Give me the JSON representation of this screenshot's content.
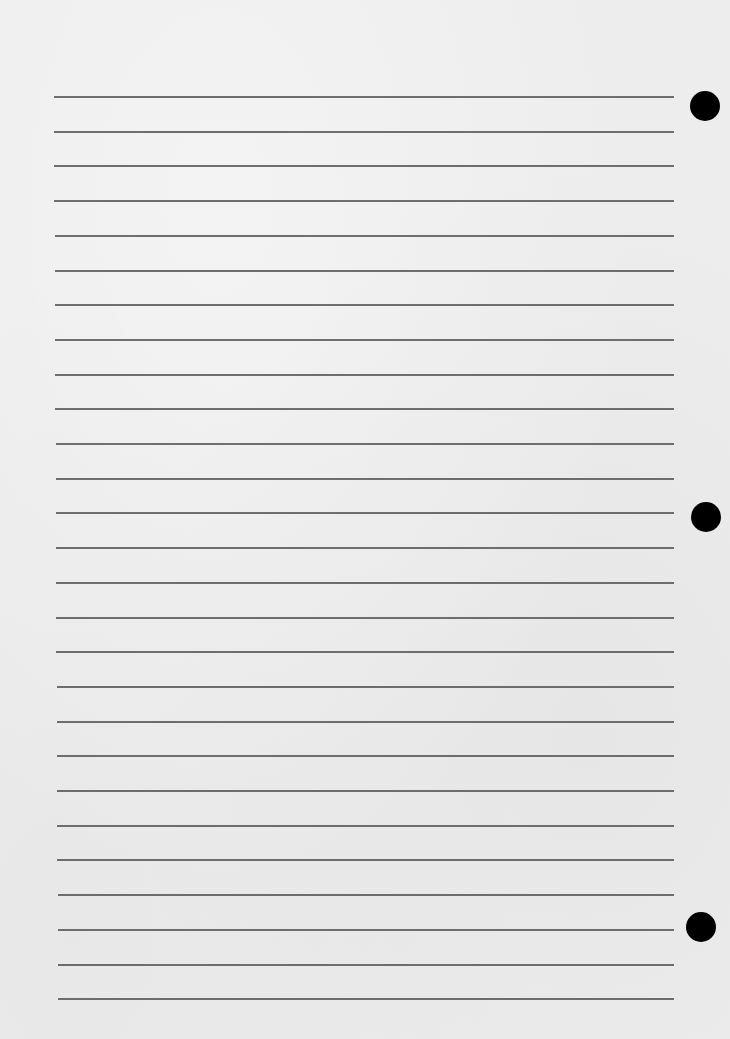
{
  "page": {
    "background_color": "#ededed",
    "line_color": "#5f5f5f",
    "hole_color": "#000000"
  },
  "rules": {
    "count": 27,
    "first_y": 96,
    "spacing": 34.7,
    "x_start_top": 54,
    "x_start_bottom": 58,
    "x_end": 674
  },
  "holes": [
    {
      "name": "top",
      "cx": 705,
      "cy": 106,
      "r": 15
    },
    {
      "name": "middle",
      "cx": 706,
      "cy": 517,
      "r": 15
    },
    {
      "name": "bottom",
      "cx": 701,
      "cy": 927,
      "r": 15
    }
  ]
}
